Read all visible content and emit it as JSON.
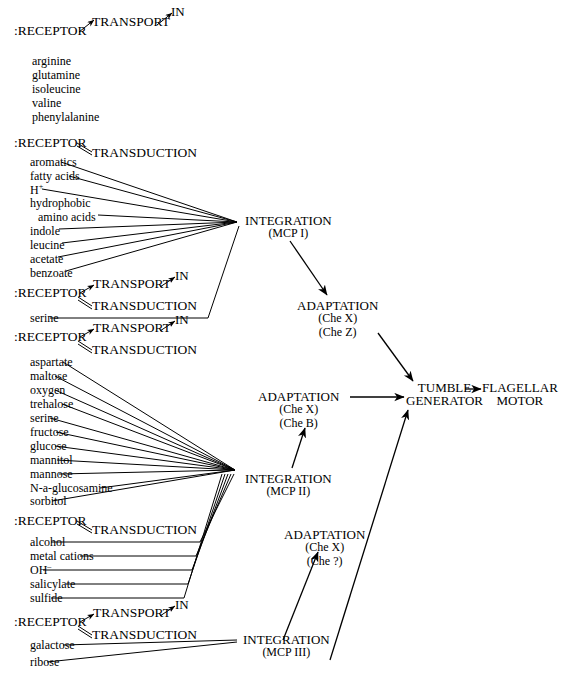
{
  "figure": {
    "background": "#ffffff",
    "ink": "#000000",
    "labels": {
      "receptor": ":RECEPTOR",
      "transport": "TRANSPORT",
      "transduction": "TRANSDUCTION",
      "in": "IN"
    }
  },
  "receptor_groups": [
    {
      "id": "group-1",
      "receptor": ":RECEPTOR",
      "pathways": [
        "TRANSPORT",
        "IN"
      ],
      "has_transduction": false,
      "ligands": [
        "arginine",
        "glutamine",
        "isoleucine",
        "valine",
        "phenylalanine"
      ],
      "target": null
    },
    {
      "id": "group-2",
      "receptor": ":RECEPTOR",
      "pathways": [
        "TRANSDUCTION"
      ],
      "has_transduction": true,
      "ligands": [
        "aromatics",
        "fatty acids",
        "H+",
        "hydrophobic",
        "amino acids",
        "indole",
        "leucine",
        "acetate",
        "benzoate"
      ],
      "target": "INTEGRATION (MCP I)"
    },
    {
      "id": "group-3",
      "receptor": ":RECEPTOR",
      "pathways": [
        "TRANSPORT",
        "IN",
        "TRANSDUCTION"
      ],
      "has_transduction": true,
      "ligands": [
        "serine"
      ],
      "target": "INTEGRATION (MCP I)"
    },
    {
      "id": "group-4",
      "receptor": ":RECEPTOR",
      "pathways": [
        "TRANSPORT",
        "IN",
        "TRANSDUCTION"
      ],
      "has_transduction": true,
      "ligands": [
        "aspartate",
        "maltose",
        "oxygen",
        "trehalose",
        "serine",
        "fructose",
        "glucose",
        "mannitol",
        "mannose",
        "N-a-glucosamine",
        "sorbitol"
      ],
      "target": "INTEGRATION (MCP II)"
    },
    {
      "id": "group-5",
      "receptor": ":RECEPTOR",
      "pathways": [
        "TRANSDUCTION"
      ],
      "has_transduction": true,
      "ligands": [
        "alcohol",
        "metal cations",
        "OH-",
        "salicylate",
        "sulfide"
      ],
      "target": "INTEGRATION (MCP II)"
    },
    {
      "id": "group-6",
      "receptor": ":RECEPTOR",
      "pathways": [
        "TRANSPORT",
        "IN",
        "TRANSDUCTION"
      ],
      "has_transduction": true,
      "ligands": [
        "galactose",
        "ribose"
      ],
      "target": "INTEGRATION (MCP III)"
    }
  ],
  "nodes": {
    "integration_1": {
      "title": "INTEGRATION",
      "subtitle": "(MCP I)"
    },
    "integration_2": {
      "title": "INTEGRATION",
      "subtitle": "(MCP II)"
    },
    "integration_3": {
      "title": "INTEGRATION",
      "subtitle": "(MCP III)"
    },
    "adaptation_1": {
      "title": "ADAPTATION",
      "line1": "(Che X)",
      "line2": "(Che Z)"
    },
    "adaptation_2": {
      "title": "ADAPTATION",
      "line1": "(Che X)",
      "line2": "(Che B)"
    },
    "adaptation_3": {
      "title": "ADAPTATION",
      "line1": "(Che X)",
      "line2": "(Che ?)"
    },
    "tumble": {
      "line1": "TUMBLE",
      "line2": "GENERATOR"
    },
    "motor": {
      "line1": "FLAGELLAR",
      "line2": "MOTOR"
    }
  }
}
